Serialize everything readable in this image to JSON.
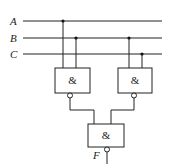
{
  "diagram": {
    "type": "logic-circuit",
    "inputs": [
      {
        "label": "A",
        "y": 21
      },
      {
        "label": "B",
        "y": 38
      },
      {
        "label": "C",
        "y": 54
      }
    ],
    "gates": [
      {
        "id": "g1",
        "symbol": "&",
        "inputs": [
          "A",
          "B"
        ],
        "inverted_output": true
      },
      {
        "id": "g2",
        "symbol": "&",
        "inputs": [
          "B",
          "C"
        ],
        "inverted_output": true
      },
      {
        "id": "g3",
        "symbol": "&",
        "inputs": [
          "g1",
          "g2"
        ],
        "inverted_output": true
      }
    ],
    "output": {
      "label": "F"
    },
    "colors": {
      "line": "#222222",
      "background": "#ffffff"
    }
  }
}
